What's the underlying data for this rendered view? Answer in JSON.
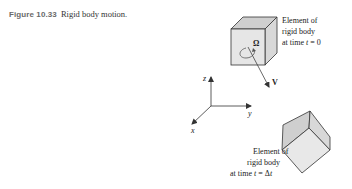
{
  "caption": {
    "number": "Figure 10.33",
    "title": "Rigid body motion."
  },
  "diagram": {
    "body_initial": {
      "label_lines": [
        "Element of",
        "rigid body",
        "at time t = 0"
      ],
      "angular_velocity_symbol": "Ω",
      "velocity_symbol": "V"
    },
    "axes": {
      "x": "x",
      "y": "y",
      "z": "z"
    },
    "body_final": {
      "label_lines": [
        "Element of",
        "rigid body",
        "at time t = Δt"
      ]
    },
    "colors": {
      "cube_front": "#e6e6e6",
      "cube_top": "#cfcfcf",
      "cube_side": "#d8d8d8",
      "stroke": "#333333",
      "caption_label": "#6a6a6a"
    }
  }
}
